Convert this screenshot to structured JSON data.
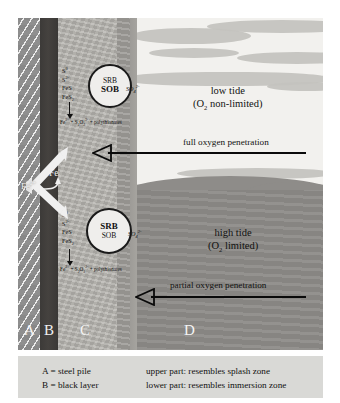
{
  "figure": {
    "zones": [
      {
        "key": "A",
        "letter": "A"
      },
      {
        "key": "B",
        "letter": "B"
      },
      {
        "key": "C",
        "letter": "C"
      },
      {
        "key": "D",
        "letter": "D"
      }
    ],
    "upper_cell": {
      "top_label": "SRB",
      "bottom_label": "SOB",
      "reactants": [
        "S⁰",
        "S²⁻",
        "FeS",
        "FeS₂"
      ],
      "side_product": "SO₄²⁻",
      "products": "Fe²⁺ + S₂O₃²⁻ + polythionates"
    },
    "lower_cell": {
      "top_label": "SRB",
      "bottom_label": "SOB",
      "reactants": [
        "S⁰",
        "S²⁻",
        "FeS",
        "FeS₂"
      ],
      "side_product": "SO₄²⁻",
      "products": "Fe²⁺ + S₂O₃²⁻ + polythionates"
    },
    "iron": {
      "ion_label": "Fe²⁺",
      "metal_label": "Fe"
    },
    "environment": {
      "low_tide_line1": "low tide",
      "low_tide_line2": "(O₂ non-limited)",
      "high_tide_line1": "high tide",
      "high_tide_line2": "(O₂ limited)",
      "full_penetration": "full oxygen penetration",
      "partial_penetration": "partial oxygen penetration"
    }
  },
  "legend": {
    "left": [
      "A = steel pile",
      "B = black layer"
    ],
    "right": [
      "upper part: resembles splash zone",
      "lower part: resembles immersion zone"
    ]
  },
  "colors": {
    "steel_pile": "#8f8f8f",
    "black_layer": "#3c3a38",
    "corrosion_layer": "#b3b1ac",
    "sky": "#f2f1ee",
    "sea": "#8e8c89",
    "legend_bg": "#d9d9d6",
    "ink": "#111111"
  }
}
